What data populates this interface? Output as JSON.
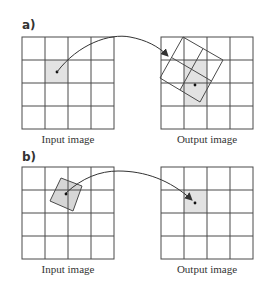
{
  "panels": [
    {
      "id": "a",
      "label": "a)",
      "input_caption": "Input image",
      "output_caption": "Output image",
      "description": "Forward mapping: input pixel is mapped onto a rotated region of the output grid"
    },
    {
      "id": "b",
      "label": "b)",
      "input_caption": "Input image",
      "output_caption": "Output image",
      "description": "Inverse mapping: output pixel is mapped back to a rotated region of the input grid"
    }
  ],
  "grid": {
    "rows": 4,
    "cols": 4
  },
  "colors": {
    "grid_line": "#4a4a4a",
    "shade": "#e2e2e2",
    "rotated_fill": "#d6d6d6",
    "arrow": "#333333",
    "text": "#333333"
  }
}
